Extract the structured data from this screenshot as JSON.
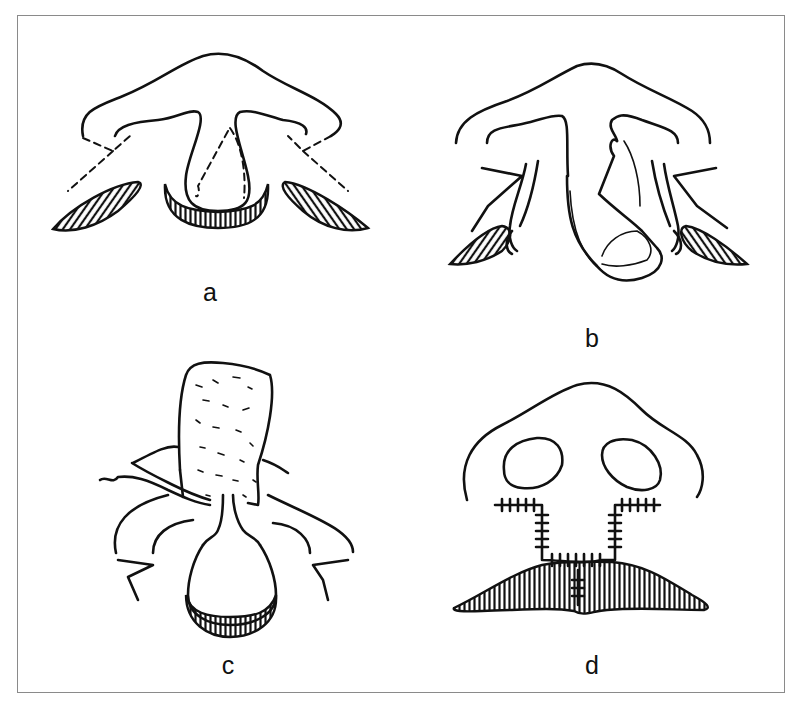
{
  "figure": {
    "panels": [
      {
        "id": "a",
        "label": "a",
        "description": "Nasal base with dashed incision lines on columella and alar bases; hatched alar-base and columella-base wedges"
      },
      {
        "id": "b",
        "label": "b",
        "description": "Columella flap elevated and rotated; lateral flaps released with hatched alar wedges"
      },
      {
        "id": "c",
        "label": "c",
        "description": "Graft (stippled) inserted with sutures; columella base with hatched rim"
      },
      {
        "id": "d",
        "label": "d",
        "description": "Final closure with nostrils, sutured incisions and hatched upper-lip segment"
      }
    ],
    "colors": {
      "ink": "#111111",
      "frame": "#8a8a8a",
      "background": "#ffffff"
    }
  }
}
